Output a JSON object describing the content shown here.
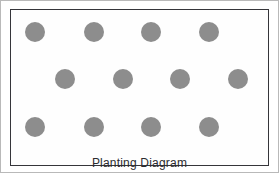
{
  "diagram": {
    "caption": "Planting Diagram",
    "title": "Planting Diagram",
    "background_color": "#ffffff",
    "border_color": "#35353a",
    "outer_frame_color": "#b9b9b9",
    "dot_color": "#8d8d8d",
    "caption_color": "#2c2c30",
    "dot_diameter": 20,
    "rows": [
      {
        "row_label": "row-1",
        "y": 33,
        "offset": "aligned",
        "count": 4,
        "dots": [
          {
            "name": "plant-dot-r1-c1",
            "x": 36,
            "y": 33
          },
          {
            "name": "plant-dot-r1-c2",
            "x": 95,
            "y": 33
          },
          {
            "name": "plant-dot-r1-c3",
            "x": 152,
            "y": 33
          },
          {
            "name": "plant-dot-r1-c4",
            "x": 210,
            "y": 33
          }
        ]
      },
      {
        "row_label": "row-2",
        "y": 80,
        "offset": "staggered",
        "count": 4,
        "dots": [
          {
            "name": "plant-dot-r2-c1",
            "x": 66,
            "y": 80
          },
          {
            "name": "plant-dot-r2-c2",
            "x": 124,
            "y": 80
          },
          {
            "name": "plant-dot-r2-c3",
            "x": 181,
            "y": 80
          },
          {
            "name": "plant-dot-r2-c4",
            "x": 239,
            "y": 80
          }
        ]
      },
      {
        "row_label": "row-3",
        "y": 128,
        "offset": "aligned",
        "count": 4,
        "dots": [
          {
            "name": "plant-dot-r3-c1",
            "x": 36,
            "y": 128
          },
          {
            "name": "plant-dot-r3-c2",
            "x": 95,
            "y": 128
          },
          {
            "name": "plant-dot-r3-c3",
            "x": 152,
            "y": 128
          },
          {
            "name": "plant-dot-r3-c4",
            "x": 210,
            "y": 128
          }
        ]
      }
    ],
    "total_plants": 12
  }
}
